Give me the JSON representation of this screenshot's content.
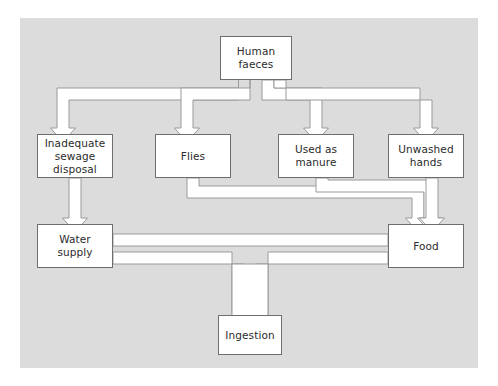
{
  "figure": {
    "canvas_color": "#dcdcdc",
    "page_color": "#ffffff",
    "box_fill": "#ffffff",
    "box_border_color": "#6e6e6e",
    "connector_fill": "#ffffff",
    "connector_stroke": "#9a9a9a",
    "text_color": "#2b2b2b"
  },
  "nodes": {
    "source": {
      "label": "Human\nfaeces"
    },
    "sewage": {
      "label": "Inadequate\nsewage\ndisposal"
    },
    "flies": {
      "label": "Flies"
    },
    "manure": {
      "label": "Used as\nmanure"
    },
    "hands": {
      "label": "Unwashed\nhands"
    },
    "water": {
      "label": "Water\nsupply"
    },
    "food": {
      "label": "Food"
    },
    "ingestion": {
      "label": "Ingestion"
    }
  },
  "edges": [
    {
      "from": "Human faeces",
      "to": "Inadequate sewage disposal"
    },
    {
      "from": "Human faeces",
      "to": "Flies"
    },
    {
      "from": "Human faeces",
      "to": "Used as manure"
    },
    {
      "from": "Human faeces",
      "to": "Unwashed hands"
    },
    {
      "from": "Inadequate sewage disposal",
      "to": "Water supply"
    },
    {
      "from": "Flies",
      "to": "Food"
    },
    {
      "from": "Used as manure",
      "to": "Food"
    },
    {
      "from": "Unwashed hands",
      "to": "Food"
    },
    {
      "from": "Water supply",
      "to": "Food"
    },
    {
      "from": "Water supply",
      "to": "Ingestion"
    },
    {
      "from": "Food",
      "to": "Ingestion"
    }
  ]
}
